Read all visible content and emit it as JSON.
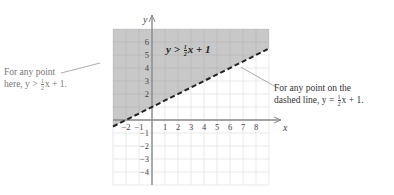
{
  "chart_data": {
    "type": "inequality-graph",
    "title": "",
    "inequality": "y > 1/2 x + 1",
    "boundary_line": {
      "slope": 0.5,
      "intercept": 1,
      "style": "dashed"
    },
    "shaded_region": "above boundary line",
    "xlabel": "x",
    "ylabel": "y",
    "xlim": [
      -3,
      9
    ],
    "ylim": [
      -5,
      7
    ],
    "x_ticks": [
      "-2",
      "-1",
      "1",
      "2",
      "3",
      "4",
      "5",
      "6",
      "7",
      "8"
    ],
    "y_ticks": [
      "6",
      "5",
      "4",
      "3",
      "2",
      "-1",
      "-2",
      "-3",
      "-4"
    ],
    "grid": true,
    "annotations": [
      {
        "text": "y > ½x + 1",
        "position": "inside shaded region"
      },
      {
        "text": "For any point here, y > ½x + 1.",
        "position": "left, pointing into shaded region"
      },
      {
        "text": "For any point on the dashed line, y = ½x + 1.",
        "position": "right, pointing to dashed line"
      }
    ]
  },
  "colors": {
    "shade": "#c8c8c8",
    "grid": "#e3e3e3",
    "grid_shaded": "#b9b9b9",
    "axis": "#8a8a8a",
    "line": "#222222"
  },
  "labels": {
    "x_axis": "x",
    "y_axis": "y",
    "inequality": {
      "lhs": "y >",
      "num": "1",
      "den": "2",
      "rhs": "x + 1"
    },
    "left_callout": {
      "line1": "For any point",
      "line2_pre": "here, y >",
      "num": "1",
      "den": "2",
      "line2_post": "x + 1."
    },
    "right_callout": {
      "line1": "For any point on the",
      "line2_pre": "dashed line, y =",
      "num": "1",
      "den": "2",
      "line2_post": "x + 1."
    }
  }
}
